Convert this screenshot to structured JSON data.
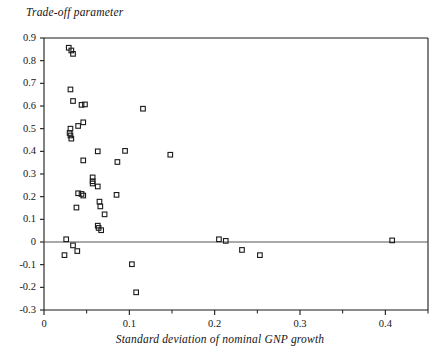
{
  "chart_data": {
    "type": "scatter",
    "title": "",
    "ylabel": "Trade-off parameter",
    "xlabel": "Standard deviation of nominal GNP growth",
    "xlim": [
      0,
      0.45
    ],
    "ylim": [
      -0.3,
      0.9
    ],
    "xticks": [
      0,
      0.1,
      0.2,
      0.3,
      0.4
    ],
    "xtick_labels": [
      "0",
      "0.1",
      "0.2",
      "0.3",
      "0.4"
    ],
    "yticks": [
      -0.3,
      -0.2,
      -0.1,
      0,
      0.1,
      0.2,
      0.3,
      0.4,
      0.5,
      0.6,
      0.7,
      0.8,
      0.9
    ],
    "ytick_labels": [
      "-0.3",
      "-0.2",
      "-0.1",
      "0",
      "0.1",
      "0.2",
      "0.3",
      "0.4",
      "0.5",
      "0.6",
      "0.7",
      "0.8",
      "0.9"
    ],
    "grid": false,
    "zero_line": true,
    "marker": "open-square",
    "marker_color": "#1a1a1a",
    "axis_color": "#1a1a1a",
    "points": [
      {
        "x": 0.029,
        "y": 0.857
      },
      {
        "x": 0.032,
        "y": 0.845
      },
      {
        "x": 0.034,
        "y": 0.83
      },
      {
        "x": 0.031,
        "y": 0.673
      },
      {
        "x": 0.034,
        "y": 0.622
      },
      {
        "x": 0.044,
        "y": 0.605
      },
      {
        "x": 0.048,
        "y": 0.607
      },
      {
        "x": 0.116,
        "y": 0.588
      },
      {
        "x": 0.046,
        "y": 0.528
      },
      {
        "x": 0.04,
        "y": 0.512
      },
      {
        "x": 0.031,
        "y": 0.5
      },
      {
        "x": 0.03,
        "y": 0.481
      },
      {
        "x": 0.031,
        "y": 0.47
      },
      {
        "x": 0.032,
        "y": 0.456
      },
      {
        "x": 0.063,
        "y": 0.4
      },
      {
        "x": 0.095,
        "y": 0.402
      },
      {
        "x": 0.148,
        "y": 0.385
      },
      {
        "x": 0.046,
        "y": 0.36
      },
      {
        "x": 0.086,
        "y": 0.353
      },
      {
        "x": 0.057,
        "y": 0.285
      },
      {
        "x": 0.057,
        "y": 0.268
      },
      {
        "x": 0.057,
        "y": 0.258
      },
      {
        "x": 0.063,
        "y": 0.245
      },
      {
        "x": 0.04,
        "y": 0.215
      },
      {
        "x": 0.044,
        "y": 0.212
      },
      {
        "x": 0.046,
        "y": 0.205
      },
      {
        "x": 0.085,
        "y": 0.208
      },
      {
        "x": 0.065,
        "y": 0.178
      },
      {
        "x": 0.066,
        "y": 0.157
      },
      {
        "x": 0.038,
        "y": 0.152
      },
      {
        "x": 0.071,
        "y": 0.122
      },
      {
        "x": 0.063,
        "y": 0.072
      },
      {
        "x": 0.064,
        "y": 0.062
      },
      {
        "x": 0.067,
        "y": 0.052
      },
      {
        "x": 0.026,
        "y": 0.012
      },
      {
        "x": 0.205,
        "y": 0.012
      },
      {
        "x": 0.213,
        "y": 0.005
      },
      {
        "x": 0.408,
        "y": 0.007
      },
      {
        "x": 0.034,
        "y": -0.015
      },
      {
        "x": 0.039,
        "y": -0.04
      },
      {
        "x": 0.024,
        "y": -0.058
      },
      {
        "x": 0.232,
        "y": -0.035
      },
      {
        "x": 0.253,
        "y": -0.058
      },
      {
        "x": 0.103,
        "y": -0.098
      },
      {
        "x": 0.108,
        "y": -0.222
      }
    ]
  }
}
